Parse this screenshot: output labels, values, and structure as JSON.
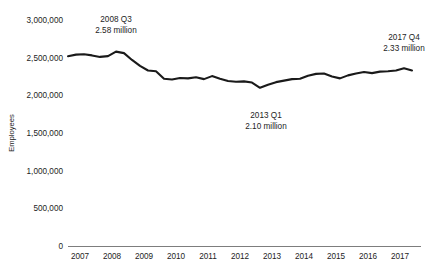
{
  "chart_data": {
    "type": "line",
    "title": "",
    "subtitle": "",
    "xlabel": "",
    "ylabel": "Employees",
    "ylim": [
      0,
      3000000
    ],
    "xlim": [
      "2007 Q1",
      "2017 Q4"
    ],
    "grid": false,
    "legend": "none",
    "y_ticks": [
      0,
      500000,
      1000000,
      1500000,
      2000000,
      2500000,
      3000000
    ],
    "y_tick_labels": [
      "0",
      "500,000",
      "1,000,000",
      "1,500,000",
      "2,000,000",
      "2,500,000",
      "3,000,000"
    ],
    "x_tick_labels": [
      "2007",
      "2008",
      "2009",
      "2010",
      "2011",
      "2012",
      "2013",
      "2014",
      "2015",
      "2016",
      "2017"
    ],
    "line_color": "#1a1a1a",
    "axis_color": "#7d7d7d",
    "series": [
      {
        "name": "Employees",
        "x": [
          "2007 Q1",
          "2007 Q2",
          "2007 Q3",
          "2007 Q4",
          "2008 Q1",
          "2008 Q2",
          "2008 Q3",
          "2008 Q4",
          "2009 Q1",
          "2009 Q2",
          "2009 Q3",
          "2009 Q4",
          "2010 Q1",
          "2010 Q2",
          "2010 Q3",
          "2010 Q4",
          "2011 Q1",
          "2011 Q2",
          "2011 Q3",
          "2011 Q4",
          "2012 Q1",
          "2012 Q2",
          "2012 Q3",
          "2012 Q4",
          "2013 Q1",
          "2013 Q2",
          "2013 Q3",
          "2013 Q4",
          "2014 Q1",
          "2014 Q2",
          "2014 Q3",
          "2014 Q4",
          "2015 Q1",
          "2015 Q2",
          "2015 Q3",
          "2015 Q4",
          "2016 Q1",
          "2016 Q2",
          "2016 Q3",
          "2016 Q4",
          "2017 Q1",
          "2017 Q2",
          "2017 Q3",
          "2017 Q4"
        ],
        "values": [
          2520000,
          2540000,
          2545000,
          2530000,
          2510000,
          2520000,
          2580000,
          2560000,
          2470000,
          2390000,
          2330000,
          2320000,
          2220000,
          2210000,
          2230000,
          2225000,
          2240000,
          2215000,
          2255000,
          2220000,
          2190000,
          2180000,
          2185000,
          2170000,
          2100000,
          2140000,
          2175000,
          2195000,
          2215000,
          2220000,
          2260000,
          2285000,
          2290000,
          2250000,
          2225000,
          2265000,
          2290000,
          2310000,
          2295000,
          2315000,
          2320000,
          2330000,
          2360000,
          2330000
        ]
      }
    ],
    "annotations": [
      {
        "id": "peak",
        "label_line1": "2008 Q3",
        "label_line2": "2.58 million",
        "point_x": "2008 Q3",
        "point_value": 2580000
      },
      {
        "id": "trough",
        "label_line1": "2013 Q1",
        "label_line2": "2.10 million",
        "point_x": "2013 Q1",
        "point_value": 2100000
      },
      {
        "id": "latest",
        "label_line1": "2017 Q4",
        "label_line2": "2.33 million",
        "point_x": "2017 Q4",
        "point_value": 2330000
      }
    ]
  }
}
